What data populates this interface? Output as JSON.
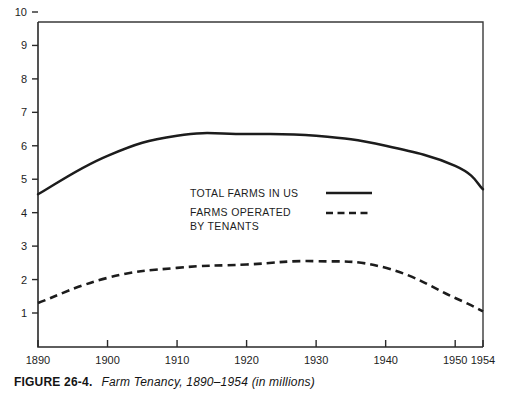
{
  "caption": {
    "figure_number": "FIGURE 26-4.",
    "title": "Farm Tenancy, 1890–1954 (in millions)"
  },
  "legend": {
    "items": [
      {
        "label": "TOTAL FARMS IN US",
        "style": "solid",
        "line_sample": "solid-line-sample"
      },
      {
        "label_line1": "FARMS OPERATED",
        "label_line2": "BY TENANTS",
        "style": "dashed",
        "line_sample": "dashed-line-sample"
      }
    ]
  },
  "chart_data": {
    "type": "line",
    "title": "Farm Tenancy, 1890–1954 (in millions)",
    "xlabel": "",
    "ylabel": "",
    "xlim": [
      1890,
      1954
    ],
    "ylim": [
      0,
      10
    ],
    "grid": false,
    "legend_position": "center",
    "y_ticks": [
      10,
      9,
      8,
      7,
      6,
      5,
      4,
      3,
      2,
      1
    ],
    "x_ticks": [
      1890,
      1900,
      1910,
      1920,
      1930,
      1940,
      1950,
      1954
    ],
    "x_tick_labels": [
      "1890",
      "1900",
      "1910",
      "1920",
      "1930",
      "1940",
      "1950",
      "1954"
    ],
    "y_tick_labels": [
      "10",
      "9",
      "8",
      "7",
      "6",
      "5",
      "4",
      "3",
      "2",
      "1"
    ],
    "x": [
      1890,
      1900,
      1910,
      1920,
      1930,
      1940,
      1950,
      1954
    ],
    "series": [
      {
        "name": "TOTAL FARMS IN US",
        "style": "solid",
        "values": [
          4.55,
          5.7,
          6.3,
          6.35,
          6.3,
          6.0,
          5.4,
          4.7
        ]
      },
      {
        "name": "FARMS OPERATED BY TENANTS",
        "style": "dashed",
        "values": [
          1.3,
          2.05,
          2.35,
          2.45,
          2.55,
          2.35,
          1.45,
          1.05
        ]
      }
    ]
  }
}
